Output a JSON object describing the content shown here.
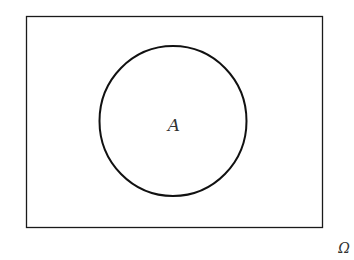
{
  "diagram": {
    "type": "venn",
    "universe": {
      "label": "Ω",
      "shape": "rectangle",
      "x": 26,
      "y": 16,
      "width": 296,
      "height": 212
    },
    "sets": [
      {
        "label": "A",
        "shape": "circle",
        "cx": 173,
        "cy": 121,
        "r": 74
      }
    ],
    "colors": {
      "stroke": "#1a1a1a",
      "text": "#333333",
      "background": "#ffffff"
    }
  }
}
